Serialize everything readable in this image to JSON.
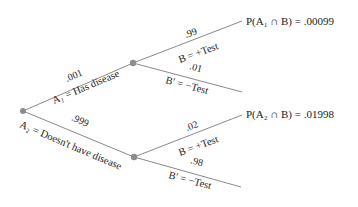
{
  "diagram": {
    "type": "probability-tree",
    "root": {
      "x": 23,
      "y": 111
    },
    "nodes": {
      "upper": {
        "x": 133,
        "y": 63
      },
      "lower": {
        "x": 134,
        "y": 157
      }
    },
    "first_level": [
      {
        "prob": ".001",
        "event": "A₁ = Has disease"
      },
      {
        "prob": ".999",
        "event": "A₂ = Doesn't have disease"
      }
    ],
    "second_level": {
      "upper": [
        {
          "prob": ".99",
          "event": "B = +Test",
          "result": "P(A₁ ∩ B) = .00099"
        },
        {
          "prob": ".01",
          "event": "B′ = −Test"
        }
      ],
      "lower": [
        {
          "prob": ".02",
          "event": "B = +Test",
          "result": "P(A₂ ∩ B) = .01998"
        },
        {
          "prob": ".98",
          "event": "B′ = −Test"
        }
      ]
    },
    "colors": {
      "line": "#8a8a8a",
      "node": "#8c8c8c",
      "text": "#222222"
    }
  }
}
